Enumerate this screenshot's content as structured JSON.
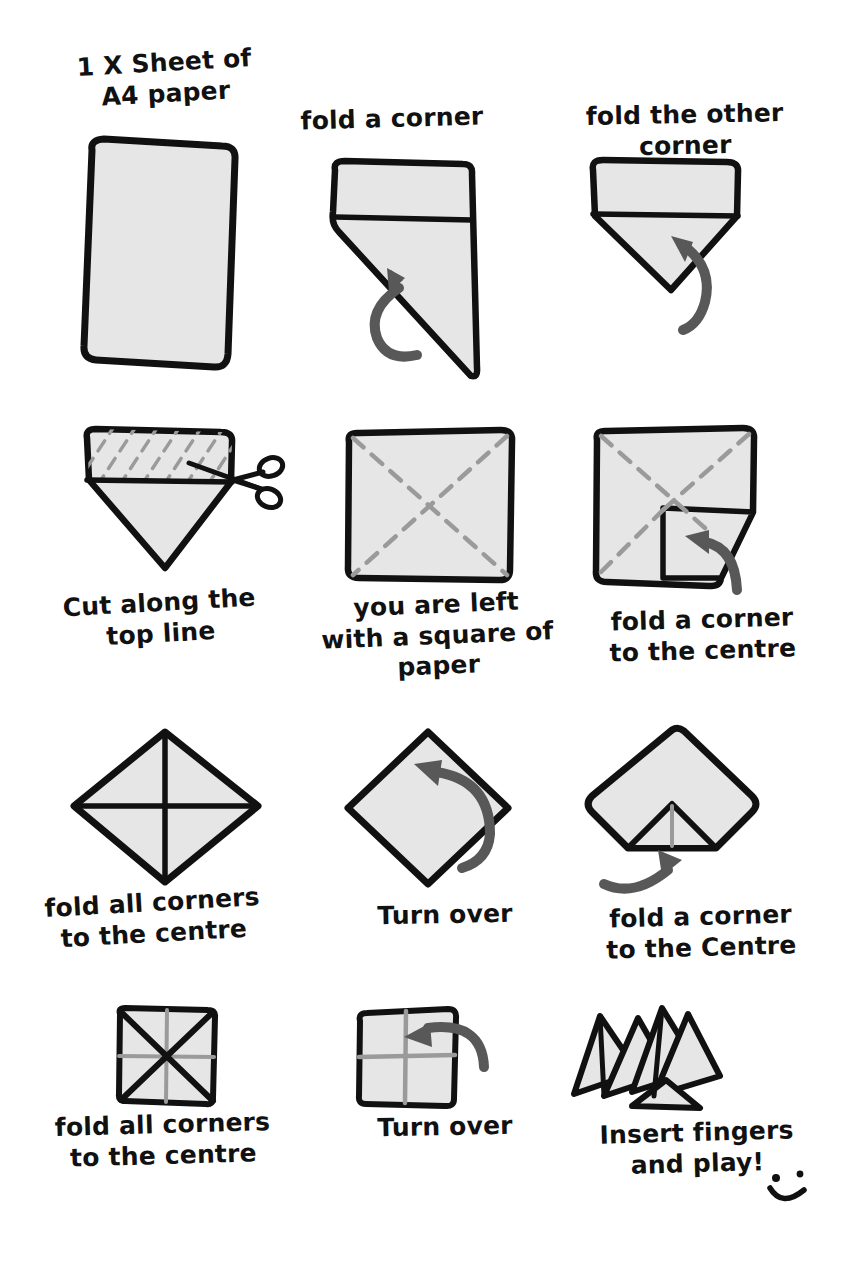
{
  "document": {
    "title": "How to fold a paper fortune teller",
    "background_color": "#ffffff",
    "ink_color": "#111111",
    "paper_fill": "#e6e6e6",
    "fold_line_color": "#9a9a9a",
    "arrow_color": "#585858"
  },
  "steps": [
    {
      "id": "step-1",
      "index": 1,
      "caption": "1 X Sheet of\nA4 paper",
      "caption_position": "above",
      "figure": "a4-sheet",
      "has_arrow": false
    },
    {
      "id": "step-2",
      "index": 2,
      "caption": "fold a corner",
      "caption_position": "above",
      "figure": "folded-one-corner",
      "has_arrow": true
    },
    {
      "id": "step-3",
      "index": 3,
      "caption": "fold the other corner",
      "caption_position": "above",
      "figure": "folded-two-corners",
      "has_arrow": true
    },
    {
      "id": "step-4",
      "index": 4,
      "caption": "Cut along the\ntop line",
      "caption_position": "below",
      "figure": "cut-top-band",
      "has_arrow": false,
      "has_scissors": true
    },
    {
      "id": "step-5",
      "index": 5,
      "caption": "you are left\nwith a square of\npaper",
      "caption_position": "below",
      "figure": "square-with-diagonals",
      "has_arrow": false
    },
    {
      "id": "step-6",
      "index": 6,
      "caption": "fold a corner\nto the centre",
      "caption_position": "below",
      "figure": "square-one-corner-folded",
      "has_arrow": true
    },
    {
      "id": "step-7",
      "index": 7,
      "caption": "fold all corners\nto the centre",
      "caption_position": "below",
      "figure": "diamond-with-cross",
      "has_arrow": false
    },
    {
      "id": "step-8",
      "index": 8,
      "caption": "Turn over",
      "caption_position": "below",
      "figure": "diamond-turn-over",
      "has_arrow": true
    },
    {
      "id": "step-9",
      "index": 9,
      "caption": "fold a corner\nto the Centre",
      "caption_position": "below",
      "figure": "diamond-corner-folded-up",
      "has_arrow": true
    },
    {
      "id": "step-10",
      "index": 10,
      "caption": "fold all corners\nto the centre",
      "caption_position": "below",
      "figure": "small-square-with-x",
      "has_arrow": false
    },
    {
      "id": "step-11",
      "index": 11,
      "caption": "Turn over",
      "caption_position": "below",
      "figure": "small-square-turn-over",
      "has_arrow": true
    },
    {
      "id": "step-12",
      "index": 12,
      "caption": "Insert fingers\nand play!",
      "caption_position": "below",
      "figure": "finished-fortune-teller",
      "has_arrow": false,
      "has_smiley": true
    }
  ],
  "icons": {
    "scissors": "scissors-icon",
    "smiley": "smiley-icon",
    "curved_arrow": "curved-arrow-icon"
  }
}
